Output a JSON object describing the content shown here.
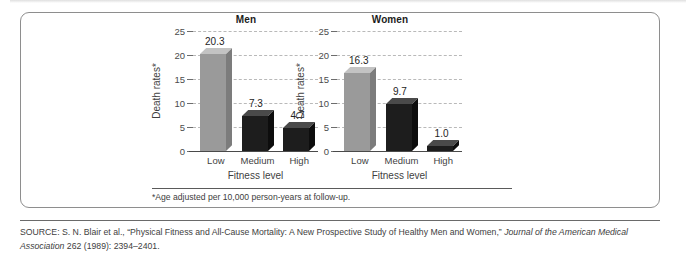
{
  "figure": {
    "footnote": "*Age adjusted per 10,000 person-years at follow-up.",
    "axis_title_y": "Death rates*",
    "axis_title_x": "Fitness level"
  },
  "source": {
    "prefix": "SOURCE: S. N. Blair et al., “Physical Fitness and All-Cause Mortality: A New Prospective Study of Healthy Men and Women,” ",
    "journal": "Journal of the American Medical Association",
    "suffix": " 262 (1989): 2394–2401."
  },
  "colors": {
    "bar_low": "#9a9a9a",
    "bar_low_top": "#c3c3c3",
    "bar_low_side": "#7c7c7c",
    "bar_dark": "#1d1d1d",
    "bar_dark_top": "#4a4a4a",
    "bar_dark_side": "#0d0d0d",
    "grid": "#b9b9b9",
    "axis": "#4a4a4a",
    "frame": "#8e8e8e"
  },
  "chart_data": [
    {
      "type": "bar",
      "title": "Men",
      "categories": [
        "Low",
        "Medium",
        "High"
      ],
      "values": [
        20.3,
        7.3,
        4.7
      ],
      "value_labels": [
        "20.3",
        "7.3",
        "4.7"
      ],
      "bar_colors": [
        "bar_low",
        "bar_dark",
        "bar_dark"
      ],
      "xlabel": "Fitness level",
      "ylabel": "Death rates*",
      "ylim": [
        0,
        25
      ],
      "yticks": [
        0,
        5,
        10,
        15,
        20,
        25
      ],
      "ytick_labels": [
        "0",
        "5",
        "10",
        "15",
        "20",
        "25"
      ],
      "grid": true,
      "legend": "none"
    },
    {
      "type": "bar",
      "title": "Women",
      "categories": [
        "Low",
        "Medium",
        "High"
      ],
      "values": [
        16.3,
        9.7,
        1.0
      ],
      "value_labels": [
        "16.3",
        "9.7",
        "1.0"
      ],
      "bar_colors": [
        "bar_low",
        "bar_dark",
        "bar_dark"
      ],
      "xlabel": "Fitness level",
      "ylabel": "Death rates*",
      "ylim": [
        0,
        25
      ],
      "yticks": [
        0,
        5,
        10,
        15,
        20,
        25
      ],
      "ytick_labels": [
        "0",
        "5",
        "10",
        "15",
        "20",
        "25"
      ],
      "grid": true,
      "legend": "none"
    }
  ]
}
